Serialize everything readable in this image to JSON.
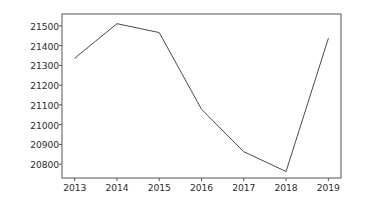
{
  "chart_data": {
    "type": "line",
    "title": "",
    "xlabel": "",
    "ylabel": "",
    "categories": [
      "2013",
      "2014",
      "2015",
      "2016",
      "2017",
      "2018",
      "2019"
    ],
    "x": [
      2013,
      2014,
      2015,
      2016,
      2017,
      2018,
      2019
    ],
    "series": [
      {
        "name": "value",
        "values": [
          21336,
          21511,
          21466,
          21078,
          20863,
          20763,
          21436
        ],
        "color": "#4a4a4a"
      }
    ],
    "xlim": [
      2012.7,
      2019.3
    ],
    "ylim": [
      20730,
      21560
    ],
    "yticks": [
      20800,
      20900,
      21000,
      21100,
      21200,
      21300,
      21400,
      21500
    ],
    "ytick_labels": [
      "20800",
      "20900",
      "21000",
      "21100",
      "21200",
      "21300",
      "21400",
      "21500"
    ],
    "xticks": [
      2013,
      2014,
      2015,
      2016,
      2017,
      2018,
      2019
    ],
    "xtick_labels": [
      "2013",
      "2014",
      "2015",
      "2016",
      "2017",
      "2018",
      "2019"
    ],
    "grid": false,
    "legend": false,
    "legend_position": "none",
    "line_color": "#4a4a4a",
    "line_width": 1,
    "marker": "none",
    "spine_color": "#555555",
    "background_color": "#ffffff",
    "tick_label_color": "#2b2b2b"
  },
  "axes": {
    "plot_left_px": 62,
    "plot_right_px": 341,
    "plot_top_px": 14,
    "plot_bottom_px": 178
  }
}
